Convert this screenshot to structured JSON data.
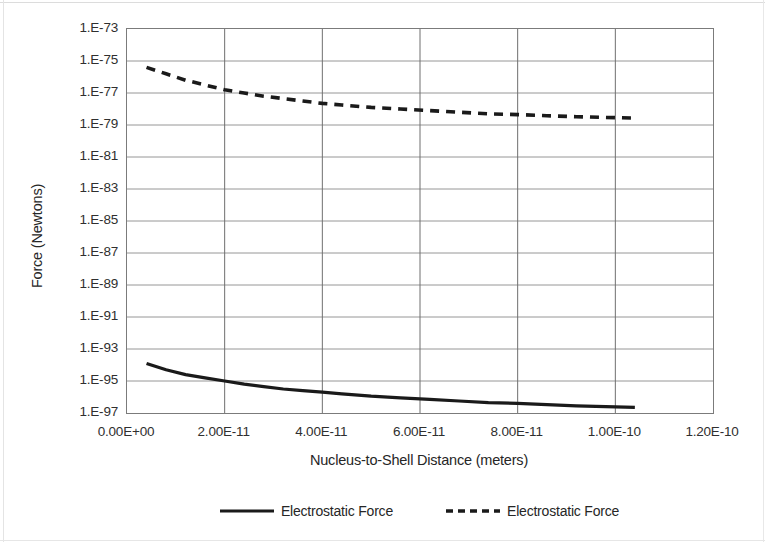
{
  "chart_data": {
    "type": "line",
    "title": "",
    "xlabel": "Nucleus-to-Shell Distance (meters)",
    "ylabel": "Force (Newtons)",
    "grid": true,
    "legend_position": "bottom",
    "yscale": "log",
    "xlim": [
      0,
      1.2e-10
    ],
    "ylim": [
      1e-97,
      1e-73
    ],
    "xtick_labels": [
      "0.00E+00",
      "2.00E-11",
      "4.00E-11",
      "6.00E-11",
      "8.00E-11",
      "1.00E-10",
      "1.20E-10"
    ],
    "xtick_values": [
      0,
      2e-11,
      4e-11,
      6e-11,
      8e-11,
      1e-10,
      1.2e-10
    ],
    "ytick_labels": [
      "1.E-73",
      "1.E-75",
      "1.E-77",
      "1.E-79",
      "1.E-81",
      "1.E-83",
      "1.E-85",
      "1.E-87",
      "1.E-89",
      "1.E-91",
      "1.E-93",
      "1.E-95",
      "1.E-97"
    ],
    "ytick_exponents": [
      -73,
      -75,
      -77,
      -79,
      -81,
      -83,
      -85,
      -87,
      -89,
      -91,
      -93,
      -95,
      -97
    ],
    "series": [
      {
        "name": "Electrostatic Force",
        "style": "solid",
        "color": "#1a1a1a",
        "x": [
          4e-12,
          8e-12,
          1.2e-11,
          1.6e-11,
          2e-11,
          2.4e-11,
          2.8e-11,
          3.2e-11,
          3.6e-11,
          4e-11,
          4.4e-11,
          5e-11,
          5.6e-11,
          6.2e-11,
          6.8e-11,
          7.4e-11,
          8e-11,
          8.6e-11,
          9.2e-11,
          9.8e-11,
          1.04e-10
        ],
        "y_exponents": [
          -93.9,
          -94.3,
          -94.6,
          -94.8,
          -95.0,
          -95.2,
          -95.35,
          -95.5,
          -95.6,
          -95.7,
          -95.8,
          -95.95,
          -96.05,
          -96.15,
          -96.25,
          -96.35,
          -96.4,
          -96.48,
          -96.55,
          -96.6,
          -96.65
        ]
      },
      {
        "name": "Electrostatic Force",
        "style": "dashed",
        "color": "#1a1a1a",
        "x": [
          4e-12,
          8e-12,
          1.2e-11,
          1.6e-11,
          2e-11,
          2.4e-11,
          2.8e-11,
          3.2e-11,
          3.6e-11,
          4e-11,
          4.4e-11,
          5e-11,
          5.6e-11,
          6.2e-11,
          6.8e-11,
          7.4e-11,
          8e-11,
          8.6e-11,
          9.2e-11,
          9.8e-11,
          1.045e-10
        ],
        "y_exponents": [
          -75.4,
          -75.8,
          -76.2,
          -76.5,
          -76.8,
          -77.0,
          -77.2,
          -77.35,
          -77.5,
          -77.65,
          -77.75,
          -77.9,
          -78.0,
          -78.1,
          -78.2,
          -78.3,
          -78.35,
          -78.42,
          -78.48,
          -78.53,
          -78.57
        ]
      }
    ]
  },
  "legend": {
    "entries": [
      {
        "label": "Electrostatic Force",
        "style": "solid"
      },
      {
        "label": "Electrostatic Force",
        "style": "dashed"
      }
    ]
  }
}
